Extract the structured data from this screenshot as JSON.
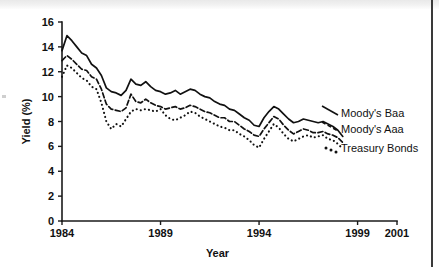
{
  "chart_data": {
    "type": "line",
    "title": "",
    "xlabel": "Year",
    "ylabel": "Yield (%)",
    "xlim": [
      1984,
      2001
    ],
    "ylim": [
      0,
      16
    ],
    "xticks": [
      1984,
      1989,
      1994,
      1999,
      2001
    ],
    "xticklabels": [
      "1984",
      "1989",
      "1994",
      "1999",
      "2001"
    ],
    "yticks": [
      0,
      2,
      4,
      6,
      8,
      10,
      12,
      14,
      16
    ],
    "yticklabels": [
      "0",
      "2",
      "4",
      "6",
      "8",
      "10",
      "12",
      "14",
      "16"
    ],
    "grid": false,
    "legend_position": "right-inline",
    "x": [
      1984.0,
      1984.25,
      1984.5,
      1984.75,
      1985.0,
      1985.25,
      1985.5,
      1985.75,
      1986.0,
      1986.25,
      1986.5,
      1986.75,
      1987.0,
      1987.25,
      1987.5,
      1987.75,
      1988.0,
      1988.25,
      1988.5,
      1988.75,
      1989.0,
      1989.25,
      1989.5,
      1989.75,
      1990.0,
      1990.25,
      1990.5,
      1990.75,
      1991.0,
      1991.25,
      1991.5,
      1991.75,
      1992.0,
      1992.25,
      1992.5,
      1992.75,
      1993.0,
      1993.25,
      1993.5,
      1993.75,
      1994.0,
      1994.25,
      1994.5,
      1994.75,
      1995.0,
      1995.25,
      1995.5,
      1995.75,
      1996.0,
      1996.25,
      1996.5,
      1996.75,
      1997.0,
      1997.25,
      1997.5,
      1997.75,
      1998.0,
      1998.25
    ],
    "series": [
      {
        "name": "Moody's Baa",
        "style": "solid",
        "values": [
          13.7,
          14.9,
          14.5,
          14.0,
          13.5,
          13.3,
          12.6,
          12.3,
          11.7,
          10.7,
          10.4,
          10.3,
          10.1,
          10.5,
          11.4,
          11.0,
          10.9,
          11.2,
          10.8,
          10.5,
          10.4,
          10.2,
          10.3,
          10.5,
          10.2,
          10.4,
          10.6,
          10.5,
          10.2,
          10.0,
          9.9,
          9.6,
          9.4,
          9.3,
          9.0,
          8.9,
          8.6,
          8.3,
          8.1,
          7.7,
          7.6,
          8.3,
          8.8,
          9.2,
          9.0,
          8.6,
          8.2,
          7.9,
          8.0,
          8.2,
          8.1,
          8.0,
          7.9,
          8.0,
          7.8,
          7.6,
          7.3,
          6.8
        ]
      },
      {
        "name": "Moody's Aaa",
        "style": "dashed",
        "values": [
          12.9,
          13.3,
          13.0,
          12.6,
          12.2,
          12.1,
          11.6,
          11.4,
          10.6,
          9.4,
          9.0,
          8.9,
          8.8,
          9.1,
          10.2,
          9.6,
          9.5,
          9.8,
          9.5,
          9.3,
          9.2,
          9.0,
          9.1,
          9.2,
          9.0,
          9.1,
          9.3,
          9.2,
          9.0,
          8.8,
          8.7,
          8.5,
          8.3,
          8.3,
          8.0,
          8.0,
          7.7,
          7.4,
          7.2,
          6.9,
          6.8,
          7.4,
          7.9,
          8.4,
          8.2,
          7.7,
          7.3,
          7.0,
          7.2,
          7.4,
          7.3,
          7.1,
          7.1,
          7.2,
          7.0,
          6.9,
          6.7,
          6.3
        ]
      },
      {
        "name": "Treasury Bonds",
        "style": "dotted",
        "values": [
          11.6,
          12.5,
          12.3,
          11.9,
          11.5,
          11.3,
          10.8,
          10.6,
          9.5,
          8.0,
          7.4,
          7.8,
          7.6,
          8.2,
          8.8,
          9.0,
          8.9,
          9.0,
          8.9,
          8.8,
          9.0,
          8.5,
          8.2,
          8.1,
          8.3,
          8.5,
          8.8,
          8.7,
          8.4,
          8.2,
          8.0,
          7.8,
          7.6,
          7.5,
          7.3,
          7.3,
          7.0,
          6.8,
          6.5,
          6.1,
          5.9,
          6.6,
          7.2,
          7.8,
          7.5,
          7.0,
          6.6,
          6.4,
          6.6,
          6.8,
          6.9,
          6.7,
          6.8,
          6.9,
          6.6,
          6.5,
          6.2,
          5.8
        ]
      }
    ]
  },
  "legend": {
    "items": [
      {
        "label": "Moody's Baa"
      },
      {
        "label": "Moody's Aaa"
      },
      {
        "label": "Treasury Bonds"
      }
    ]
  }
}
